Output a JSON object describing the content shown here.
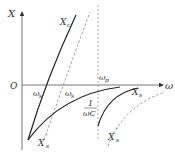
{
  "diagram": {
    "axes": {
      "y_label": "X",
      "x_label": "ω",
      "origin_label": "O"
    },
    "curves": [
      {
        "name": "X_c",
        "label": "X",
        "sub": "c",
        "style": "solid"
      },
      {
        "name": "X_c_prime",
        "style": "dashed"
      },
      {
        "name": "X_s",
        "label": "X",
        "sub": "s",
        "style": "solid"
      },
      {
        "name": "X_s_prime_left",
        "label": "X",
        "sub": "s",
        "prime": "'",
        "style": "solid"
      },
      {
        "name": "X_s_prime_right",
        "label": "X",
        "sub": "s",
        "prime": "'",
        "style": "dashed"
      }
    ],
    "markers": {
      "omega_s": {
        "label": "ω",
        "sub": "s"
      },
      "omega_s_prime": {
        "label": "ω",
        "sub": "s"
      },
      "omega_p": {
        "label": "ω",
        "sub": "p"
      }
    },
    "annotation": {
      "numerator": "1",
      "denominator": "ωC"
    },
    "colors": {
      "line": "#333333",
      "dashed": "#777777"
    }
  }
}
